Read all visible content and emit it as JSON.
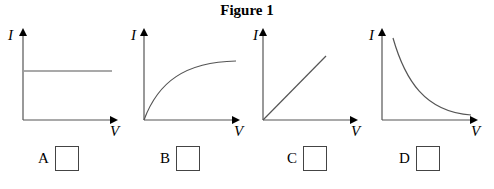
{
  "figure": {
    "title": "Figure 1",
    "axis_y_label": "I",
    "axis_x_label": "V",
    "graphs": [
      {
        "id": "A",
        "shape": "horizontal line (constant current)"
      },
      {
        "id": "B",
        "shape": "increasing curve leveling off"
      },
      {
        "id": "C",
        "shape": "straight line through origin"
      },
      {
        "id": "D",
        "shape": "decreasing curve (inverse)"
      }
    ]
  },
  "options": [
    {
      "label": "A"
    },
    {
      "label": "B"
    },
    {
      "label": "C"
    },
    {
      "label": "D"
    }
  ],
  "colors": {
    "axis": "#000000",
    "curve": "#444444",
    "box_border": "#444444"
  }
}
